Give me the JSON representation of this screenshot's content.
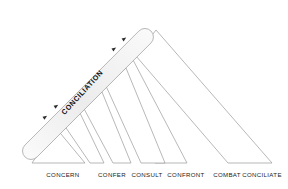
{
  "diagram": {
    "arrow_band": {
      "label": "CONCILIATION",
      "direction": "up-right",
      "arrowhead_count": 4,
      "fill_color": "#f1f1f1",
      "stroke_color": "#9a9a9a",
      "arrowhead_color": "#2b2b2b"
    },
    "stroke_color": "#9a9a9a",
    "wedge_fill": "#ffffff",
    "baseline_y": 165,
    "stages": [
      {
        "label": "CONCERN",
        "label_x": 63,
        "label_y": 177,
        "apex_x": 56,
        "apex_y": 128,
        "base_left_x": 32,
        "base_right_x": 85,
        "inner": false
      },
      {
        "label": "CONFER",
        "label_x": 112,
        "label_y": 177,
        "apex_x": 79,
        "apex_y": 111,
        "base_left_x": 58,
        "base_right_x": 104,
        "inner": true
      },
      {
        "label": "CONSULT",
        "label_x": 147,
        "label_y": 177,
        "apex_x": 102,
        "apex_y": 92,
        "base_left_x": 82,
        "base_right_x": 131,
        "inner": true
      },
      {
        "label": "CONFRONT",
        "label_x": 186,
        "label_y": 177,
        "apex_x": 126,
        "apex_y": 68,
        "base_left_x": 106,
        "base_right_x": 165,
        "inner": true
      },
      {
        "label": "COMBAT",
        "label_x": 227,
        "label_y": 177,
        "apex_x": 132,
        "apex_y": 58,
        "base_left_x": 113,
        "base_right_x": 187,
        "inner": true
      },
      {
        "label": "CONCILIATE",
        "label_x": 262,
        "label_y": 177,
        "apex_x": 156,
        "apex_y": 30,
        "base_left_x": 136,
        "base_right_x": 272,
        "inner": true
      }
    ]
  }
}
